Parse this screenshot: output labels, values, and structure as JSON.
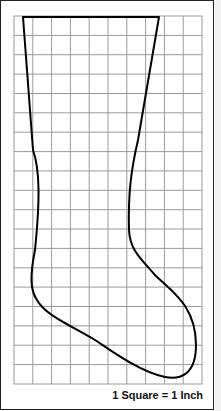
{
  "diagram": {
    "grid": {
      "columns": 10,
      "rows": 19,
      "color": "#9a9a9a"
    },
    "outline_color": "#000000",
    "scale_caption": "1 Square = 1 Inch"
  }
}
